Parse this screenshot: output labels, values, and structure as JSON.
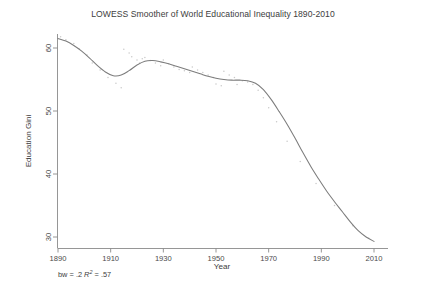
{
  "chart_data": {
    "type": "line",
    "title": "LOWESS Smoother of World Educational Inequality 1890-2010",
    "xlabel": "Year",
    "ylabel": "Education Gini",
    "xlim": [
      1890,
      2010
    ],
    "ylim": [
      28.5,
      62.5
    ],
    "xticks": [
      1890,
      1910,
      1930,
      1950,
      1970,
      1990,
      2010
    ],
    "yticks": [
      30,
      40,
      50,
      60
    ],
    "grid": false,
    "legend": null,
    "annotation_bw_label": "bw = ",
    "annotation_bw_value": ".2",
    "annotation_r_symbol": "R",
    "annotation_r_exponent": "2",
    "annotation_r_equals": " = ",
    "annotation_r_value": ".57",
    "annotation_full": "bw = .2 R2 = .57",
    "series": [
      {
        "name": "LOWESS smoother",
        "style": "solid-line",
        "color": "#7c7c7c",
        "x": [
          1890,
          1893,
          1896,
          1899,
          1902,
          1905,
          1908,
          1911,
          1914,
          1917,
          1920,
          1923,
          1926,
          1929,
          1932,
          1935,
          1938,
          1941,
          1944,
          1947,
          1950,
          1953,
          1956,
          1959,
          1962,
          1965,
          1968,
          1971,
          1974,
          1977,
          1980,
          1983,
          1986,
          1989,
          1992,
          1995,
          1998,
          2001,
          2004,
          2007,
          2010
        ],
        "y": [
          61.5,
          61.1,
          60.4,
          59.5,
          58.4,
          57.2,
          56.2,
          55.6,
          55.7,
          56.4,
          57.3,
          57.9,
          58.0,
          57.8,
          57.5,
          57.1,
          56.7,
          56.3,
          55.9,
          55.5,
          55.2,
          55.0,
          54.9,
          54.9,
          54.8,
          54.4,
          53.4,
          51.8,
          49.9,
          47.9,
          45.7,
          43.4,
          41.2,
          39.2,
          37.3,
          35.6,
          34.0,
          32.4,
          31.0,
          30.0,
          29.3
        ]
      },
      {
        "name": "scatter data points",
        "style": "faint-dots",
        "color": "#c9c9c9",
        "x": [
          1891,
          1893,
          1896,
          1898,
          1901,
          1903,
          1906,
          1909,
          1912,
          1914,
          1915,
          1917,
          1918,
          1920,
          1921,
          1922,
          1923,
          1925,
          1927,
          1929,
          1930,
          1932,
          1934,
          1936,
          1938,
          1940,
          1941,
          1943,
          1945,
          1947,
          1949,
          1950,
          1952,
          1953,
          1955,
          1957,
          1958,
          1960,
          1962,
          1964,
          1966,
          1968,
          1970,
          1973,
          1977,
          1982,
          1988,
          1995,
          2002,
          2008
        ],
        "y": [
          61.8,
          61.3,
          60.7,
          59.9,
          58.9,
          57.6,
          56.5,
          55.3,
          54.4,
          53.7,
          59.8,
          59.2,
          58.6,
          58.1,
          57.6,
          58.3,
          58.5,
          58.0,
          57.6,
          57.2,
          58.1,
          57.5,
          57.0,
          56.6,
          56.4,
          56.1,
          57.0,
          56.5,
          56.1,
          55.7,
          55.3,
          54.3,
          54.0,
          56.3,
          55.7,
          55.3,
          54.2,
          54.8,
          54.6,
          54.2,
          53.3,
          52.1,
          50.5,
          48.3,
          45.2,
          42.0,
          38.5,
          35.0,
          31.8,
          29.8
        ]
      }
    ]
  },
  "figure": {
    "background_color": "#ffffff",
    "axis_color": "#8a8a8a",
    "text_color": "#3d3d3d"
  }
}
